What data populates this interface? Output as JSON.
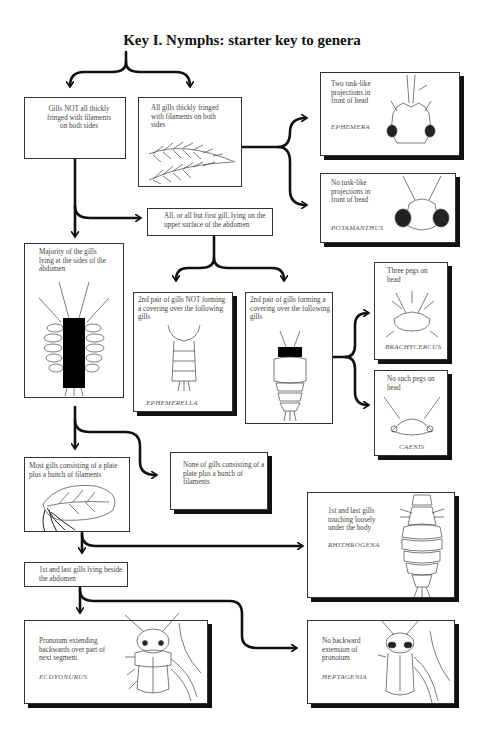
{
  "title": "Key I. Nymphs: starter key to genera",
  "nodes": {
    "gills_not_fringed": {
      "text": "Gills NOT all thickly fringed with filaments on both sides"
    },
    "gills_fringed": {
      "text": "All gills thickly fringed with filaments on both sides"
    },
    "ephemera": {
      "text": "Two tusk-like projections in front of head",
      "genus": "EPHEMERA"
    },
    "potamanthus": {
      "text": "No tusk-like projections in front of head",
      "genus": "POTAMANTHUS"
    },
    "upper_surface": {
      "text": "All, or all but first gill, lying on the upper surface of the abdomen"
    },
    "sides_abdomen": {
      "text": "Majority of the gills lying at the sides of the abdomen"
    },
    "not_covering": {
      "text": "2nd pair of gills NOT forming a covering over the following gills",
      "genus": "EPHEMERELLA"
    },
    "covering": {
      "text": "2nd pair of gills forming a covering over the following gills"
    },
    "brachycercus": {
      "text": "Three pegs on head",
      "genus": "BRACHYCERCUS"
    },
    "caenis": {
      "text": "No such pegs on head",
      "genus": "CAENIS"
    },
    "plate_filaments": {
      "text": "Most gills consisting of a plate plus a bunch of filaments"
    },
    "no_plate": {
      "text": "None of gills consisting of a plate plus a bunch of filaments"
    },
    "rhithrogena": {
      "text": "1st and last gills touching loosely under the body",
      "genus": "RHITHROGENA"
    },
    "beside_abdomen": {
      "text": "1st and last gills lying beside the abdomen"
    },
    "ecdyonurus": {
      "text": "Pronotum extending backwards over part of next segment",
      "genus": "ECDYONURUS"
    },
    "heptagenia": {
      "text": "No backward extension of pronotum",
      "genus": "HEPTAGENIA"
    }
  },
  "edges": [
    [
      "root",
      "gills_not_fringed"
    ],
    [
      "root",
      "gills_fringed"
    ],
    [
      "gills_fringed",
      "ephemera"
    ],
    [
      "gills_fringed",
      "potamanthus"
    ],
    [
      "gills_not_fringed",
      "upper_surface"
    ],
    [
      "gills_not_fringed",
      "sides_abdomen"
    ],
    [
      "upper_surface",
      "not_covering"
    ],
    [
      "upper_surface",
      "covering"
    ],
    [
      "covering",
      "brachycercus"
    ],
    [
      "covering",
      "caenis"
    ],
    [
      "sides_abdomen",
      "plate_filaments"
    ],
    [
      "sides_abdomen",
      "no_plate"
    ],
    [
      "plate_filaments",
      "rhithrogena"
    ],
    [
      "plate_filaments",
      "beside_abdomen"
    ],
    [
      "beside_abdomen",
      "ecdyonurus"
    ],
    [
      "beside_abdomen",
      "heptagenia"
    ]
  ]
}
